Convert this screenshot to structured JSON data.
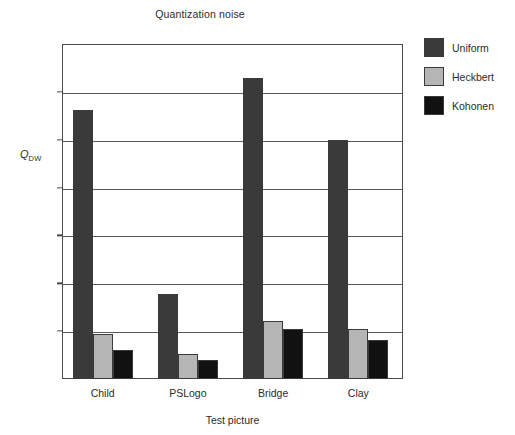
{
  "chart_data": {
    "type": "bar",
    "title": "Quantization noise",
    "xlabel": "Test picture",
    "ylabel": "Q",
    "ylabel_sub": "DW",
    "categories": [
      "Child",
      "PSLogo",
      "Bridge",
      "Clay"
    ],
    "series": [
      {
        "name": "Uniform",
        "color": "#3a3a3a",
        "values": [
          28.1,
          8.9,
          31.5,
          25.0
        ]
      },
      {
        "name": "Heckbert",
        "color": "#b5b5b5",
        "values": [
          4.75,
          2.6,
          6.1,
          5.2
        ]
      },
      {
        "name": "Kohonen",
        "color": "#111111",
        "values": [
          3.0,
          2.0,
          5.25,
          4.1
        ]
      }
    ],
    "ylim": [
      0,
      35
    ],
    "yticks": [
      0,
      5,
      10,
      15,
      20,
      25,
      30,
      35
    ],
    "ytick_labels": [
      "0",
      "5",
      "10",
      "15",
      "20",
      "25",
      "30",
      "35"
    ],
    "grid": true,
    "grid_axis": "y",
    "legend_position": "right-top",
    "background": "#ffffff",
    "axis_color": "#4a4a4a"
  }
}
